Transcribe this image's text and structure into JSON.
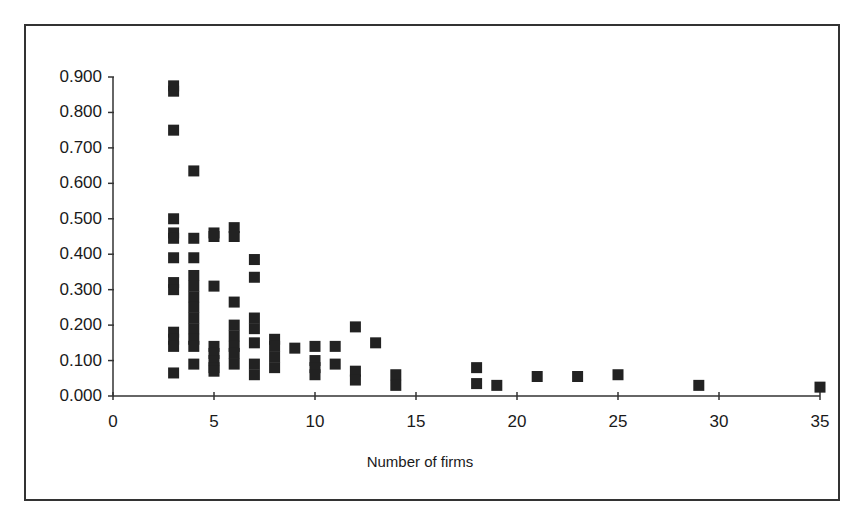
{
  "chart_data": {
    "type": "scatter",
    "title": "",
    "xlabel": "Number of firms",
    "ylabel": "",
    "xlim": [
      0,
      35
    ],
    "ylim": [
      0,
      0.9
    ],
    "x_ticks": [
      0,
      5,
      10,
      15,
      20,
      25,
      30,
      35
    ],
    "x_tick_labels": [
      "0",
      "5",
      "10",
      "15",
      "20",
      "25",
      "30",
      "35"
    ],
    "y_ticks": [
      0,
      0.1,
      0.2,
      0.3,
      0.4,
      0.5,
      0.6,
      0.7,
      0.8,
      0.9
    ],
    "y_tick_labels": [
      "0.000",
      "0.100",
      "0.200",
      "0.300",
      "0.400",
      "0.500",
      "0.600",
      "0.700",
      "0.800",
      "0.900"
    ],
    "grid": false,
    "legend": null,
    "marker": "square",
    "marker_color": "#222222",
    "series": [
      {
        "name": "observations",
        "points": [
          [
            3,
            0.875
          ],
          [
            3,
            0.86
          ],
          [
            3,
            0.75
          ],
          [
            3,
            0.5
          ],
          [
            3,
            0.46
          ],
          [
            3,
            0.445
          ],
          [
            3,
            0.39
          ],
          [
            3,
            0.32
          ],
          [
            3,
            0.3
          ],
          [
            3,
            0.18
          ],
          [
            3,
            0.16
          ],
          [
            3,
            0.14
          ],
          [
            3,
            0.065
          ],
          [
            4,
            0.635
          ],
          [
            4,
            0.445
          ],
          [
            4,
            0.39
          ],
          [
            4,
            0.34
          ],
          [
            4,
            0.31
          ],
          [
            4,
            0.28
          ],
          [
            4,
            0.25
          ],
          [
            4,
            0.22
          ],
          [
            4,
            0.19
          ],
          [
            4,
            0.16
          ],
          [
            4,
            0.14
          ],
          [
            4,
            0.09
          ],
          [
            5,
            0.46
          ],
          [
            5,
            0.45
          ],
          [
            5,
            0.31
          ],
          [
            5,
            0.14
          ],
          [
            5,
            0.12
          ],
          [
            5,
            0.1
          ],
          [
            5,
            0.08
          ],
          [
            5,
            0.07
          ],
          [
            6,
            0.475
          ],
          [
            6,
            0.45
          ],
          [
            6,
            0.265
          ],
          [
            6,
            0.2
          ],
          [
            6,
            0.17
          ],
          [
            6,
            0.14
          ],
          [
            6,
            0.12
          ],
          [
            6,
            0.09
          ],
          [
            7,
            0.385
          ],
          [
            7,
            0.335
          ],
          [
            7,
            0.22
          ],
          [
            7,
            0.19
          ],
          [
            7,
            0.15
          ],
          [
            7,
            0.09
          ],
          [
            7,
            0.06
          ],
          [
            8,
            0.16
          ],
          [
            8,
            0.14
          ],
          [
            8,
            0.11
          ],
          [
            8,
            0.08
          ],
          [
            9,
            0.135
          ],
          [
            10,
            0.14
          ],
          [
            10,
            0.1
          ],
          [
            10,
            0.08
          ],
          [
            10,
            0.06
          ],
          [
            11,
            0.14
          ],
          [
            11,
            0.09
          ],
          [
            12,
            0.195
          ],
          [
            12,
            0.07
          ],
          [
            12,
            0.045
          ],
          [
            13,
            0.15
          ],
          [
            14,
            0.06
          ],
          [
            14,
            0.03
          ],
          [
            18,
            0.08
          ],
          [
            18,
            0.035
          ],
          [
            19,
            0.03
          ],
          [
            21,
            0.055
          ],
          [
            23,
            0.055
          ],
          [
            25,
            0.06
          ],
          [
            29,
            0.03
          ],
          [
            35,
            0.025
          ]
        ]
      }
    ]
  }
}
